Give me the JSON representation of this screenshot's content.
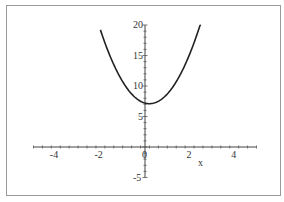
{
  "chart_data": {
    "type": "line",
    "title": "",
    "xlabel": "x",
    "ylabel": "",
    "xlim": [
      -5,
      5
    ],
    "ylim": [
      -5,
      20
    ],
    "x_ticks": [
      -4,
      -2,
      0,
      2,
      4
    ],
    "x_tick_labels": [
      "-4",
      "-2",
      "0",
      "2",
      "4"
    ],
    "y_ticks": [
      -5,
      5,
      10,
      15,
      20
    ],
    "y_tick_labels": [
      "-5",
      "5",
      "10",
      "15",
      "20"
    ],
    "grid": false,
    "legend": null,
    "series": [
      {
        "name": "parabola",
        "color": "#222222",
        "x": [
          -2.0,
          -1.5,
          -1.0,
          -0.5,
          0.0,
          0.2,
          0.5,
          1.0,
          1.5,
          2.0,
          2.5
        ],
        "values": [
          19.2,
          14.3,
          10.7,
          8.3,
          7.2,
          7.1,
          7.3,
          8.7,
          11.3,
          15.2,
          20.3
        ]
      }
    ],
    "annotations": []
  }
}
